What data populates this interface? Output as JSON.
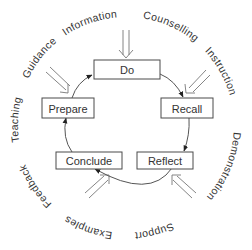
{
  "diagram": {
    "type": "cycle",
    "stages": [
      {
        "id": "do",
        "label": "Do"
      },
      {
        "id": "recall",
        "label": "Recall"
      },
      {
        "id": "reflect",
        "label": "Reflect"
      },
      {
        "id": "conclude",
        "label": "Conclude"
      },
      {
        "id": "prepare",
        "label": "Prepare"
      }
    ],
    "flow": [
      "Do",
      "Recall",
      "Reflect",
      "Conclude",
      "Prepare",
      "Do"
    ],
    "outer_ring_labels": {
      "information": "Information",
      "counselling": "Counselling",
      "instruction": "Instruction",
      "demonstration": "Demonstration",
      "support": "Support",
      "examples": "Examples",
      "feedback": "Feedback",
      "teaching": "Teaching",
      "guidance": "Guidance"
    },
    "colors": {
      "line": "#555555",
      "text": "#333333",
      "background": "#ffffff"
    }
  }
}
